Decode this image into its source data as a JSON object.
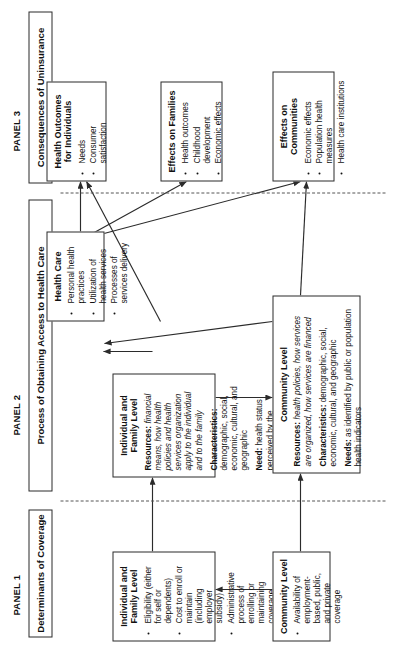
{
  "figure": {
    "orientation": "rotated-90-ccw",
    "panels": [
      {
        "id": "panel1",
        "title": "PANEL 1",
        "header": "Determinants of Coverage"
      },
      {
        "id": "panel2",
        "title": "PANEL 2",
        "header": "Process of Obtaining Access to Health Care"
      },
      {
        "id": "panel3",
        "title": "PANEL 3",
        "header": "Consequences of Uninsurance"
      }
    ]
  },
  "panel1": {
    "individual": {
      "title": "Individual and Family Level",
      "bullets": [
        "Eligibility (either for self or dependents)",
        "Cost to enroll or maintain (including employer subsidy)",
        "Administrative process of enrolling or maintaining coverage",
        "Knowledge of eligibility"
      ],
      "need_label": "Need:",
      "need_text": " decision to enroll or to maintain"
    },
    "community": {
      "title": "Community Level",
      "bullets": [
        "Availability of employment-based, public, and private coverage"
      ]
    }
  },
  "panel2": {
    "individual": {
      "title": "Individual and Family Level",
      "resources_label": "Resources:",
      "resources_text": " financial means, how health policies and health services organization apply to the individual and to the family",
      "characteristics_label": "Characteristics:",
      "characteristics_text": " demographic, social, economic, cultural, and geographic",
      "need_label": "Need:",
      "need_text": " health status perceived by the individual or family member and as evaluated by others"
    },
    "healthcare": {
      "title": "Health Care",
      "bullets": [
        "Personal health practices",
        "Utilization of health services",
        "Processes of services delivery"
      ]
    },
    "community": {
      "title": "Community Level",
      "resources_label": "Resources:",
      "resources_text": " health policies, how services are organized, how services are financed",
      "characteristics_label": "Characteristics:",
      "characteristics_text": " demographic, social, economic, cultural, and geographic",
      "needs_label": "Needs:",
      "needs_text": " as identified by public or population health indicators"
    }
  },
  "panel3": {
    "health_outcomes": {
      "title": "Health Outcomes for Individuals",
      "bullets": [
        "Needs",
        "Consumer satisfaction"
      ]
    },
    "families": {
      "title": "Effects on Families",
      "bullets": [
        "Health outcomes",
        "Childhood development",
        "Economic effects"
      ]
    },
    "communities": {
      "title": "Effects on Communities",
      "bullets": [
        "Economic effects",
        "Population health measures",
        "Health care institutions"
      ]
    }
  },
  "colors": {
    "stroke": "#2b2b2b",
    "divider": "#555555",
    "background": "#ffffff",
    "text": "#111111"
  }
}
